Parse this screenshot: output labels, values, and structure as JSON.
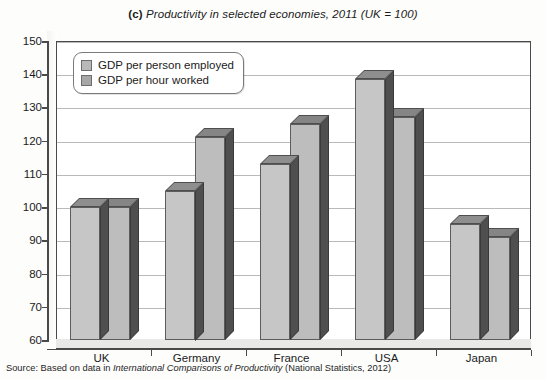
{
  "figure": {
    "label": "(c)",
    "title": "Productivity in selected economies, 2011 (UK = 100)",
    "title_full": "(c) Productivity in selected economies, 2011 (UK = 100)",
    "source_prefix": "Source: Based on data in ",
    "source_italic": "International Comparisons of Productivity",
    "source_suffix": " (National Statistics, 2012)",
    "source_full": "Source: Based on data in International Comparisons of Productivity (National Statistics, 2012)"
  },
  "chart_data": {
    "type": "bar",
    "title": "(c) Productivity in selected economies, 2011 (UK = 100)",
    "xlabel": "",
    "ylabel": "",
    "categories": [
      "UK",
      "Germany",
      "France",
      "USA",
      "Japan"
    ],
    "series": [
      {
        "name": "GDP per person employed",
        "values": [
          100,
          105,
          113,
          138.5,
          95
        ]
      },
      {
        "name": "GDP per hour worked",
        "values": [
          100,
          121,
          125,
          127,
          91
        ]
      }
    ],
    "ylim": [
      60,
      150
    ],
    "yticks": [
      60,
      70,
      80,
      90,
      100,
      110,
      120,
      130,
      140,
      150
    ],
    "ytick_labels": [
      "60",
      "70",
      "80",
      "90",
      "100",
      "110",
      "120",
      "130",
      "140",
      "150"
    ],
    "grid": true,
    "legend_position": "top-left",
    "style": "3d-column",
    "colors": {
      "series1_front": "#c6c6c6",
      "series2_front": "#bdbdbd",
      "bar_top": "#8e8e8e",
      "bar_side": "#4f4f4f",
      "gridline": "#b9b9b9",
      "axis": "#4a4a4a",
      "plot_background": "#ffffff",
      "page_background": "#fdfdfc"
    }
  },
  "legend": {
    "items": [
      {
        "label": "GDP per person employed"
      },
      {
        "label": "GDP per hour worked"
      }
    ]
  }
}
